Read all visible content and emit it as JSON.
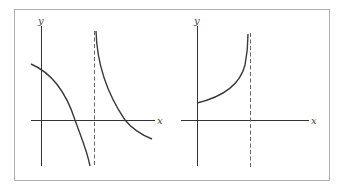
{
  "figure": {
    "frame_color": "#b0b0b0",
    "axis_color": "#333333",
    "curve_color": "#3a3a3a",
    "asymptote_color": "#666666"
  },
  "panels": [
    {
      "id": "left",
      "x_axis_label": "x",
      "y_axis_label": "y",
      "asymptote": "vertical dashed line right of y-axis",
      "description": "Decreasing curve with vertical asymptote: left branch starts above x-axis at left edge, crosses x-axis, plunges to -infinity at asymptote; right branch descends from +infinity, crosses x-axis, continues decreasing below x-axis"
    },
    {
      "id": "right",
      "x_axis_label": "x",
      "y_axis_label": "y",
      "asymptote": "vertical dashed line right of y-axis",
      "description": "Increasing curve starting at positive y-intercept, rising to +infinity at vertical asymptote"
    }
  ]
}
